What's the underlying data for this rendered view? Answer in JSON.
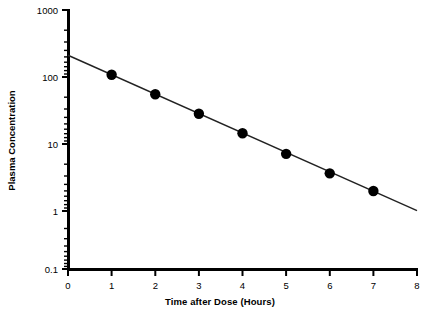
{
  "chart_data": {
    "type": "scatter",
    "title": "",
    "subtitle": "",
    "xlabel": "Time after Dose (Hours)",
    "ylabel": "Plasma Concentration",
    "yscale": "log",
    "xscale": "linear",
    "xlim": [
      0,
      8
    ],
    "ylim": [
      0.1,
      1000
    ],
    "xticks": [
      0,
      1,
      2,
      3,
      4,
      5,
      6,
      7,
      8
    ],
    "xticklabels": [
      "0",
      "1",
      "2",
      "3",
      "4",
      "5",
      "6",
      "7",
      "8"
    ],
    "yticks": [
      0.1,
      1,
      10,
      100,
      1000
    ],
    "yticklabels": [
      "0.1",
      "1",
      "10",
      "100",
      "1000"
    ],
    "minor_ticks": true,
    "grid": false,
    "legend": null,
    "x": [
      1,
      2,
      3,
      4,
      5,
      6,
      7
    ],
    "values": [
      100,
      50,
      25,
      12.5,
      6,
      3,
      1.6
    ],
    "series": [
      {
        "name": "Plasma Concentration",
        "marker": "filled-circle",
        "x": [
          1,
          2,
          3,
          4,
          5,
          6,
          7
        ],
        "values": [
          100,
          50,
          25,
          12.5,
          6,
          3,
          1.6
        ]
      }
    ],
    "fit_line": {
      "name": "log-linear regression",
      "x_start": 0,
      "y_start": 200,
      "x_end": 8,
      "y_end": 0.8
    },
    "annotations": []
  },
  "axes": {
    "x_axis_name": "Time after Dose (Hours)",
    "y_axis_name": "Plasma Concentration"
  }
}
